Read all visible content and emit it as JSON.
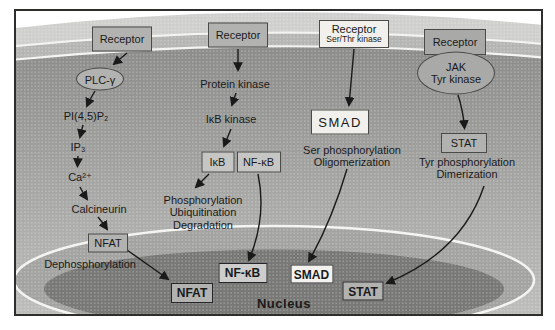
{
  "colors": {
    "ink": "#1a1a1a",
    "membrane_light": "#cfcfcd",
    "membrane_dark": "#b5b5b3",
    "cytoplasm_top": "#8c8c8a",
    "cytoplasm_bottom": "#bdbdbb",
    "nucleus_rim": "#a3a3a1",
    "nucleus_interior": "#787876",
    "highlight": "#f4f4f2",
    "box_gray": "#b2b2b0",
    "box_light_gray": "#c6c6c4",
    "box_white": "#f1f0ec",
    "border_dark": "#4a4a48"
  },
  "pathways": {
    "calcium_nfat": {
      "receptor": "Receptor",
      "plc": "PLC-γ",
      "pip2": "PI(4,5)P₂",
      "ip3": "IP₃",
      "calcium": "Ca²⁺",
      "calcineurin": "Calcineurin",
      "factor": "NFAT",
      "process": "Dephosphorylation"
    },
    "nfkb": {
      "receptor": "Receptor",
      "kinase1": "Protein kinase",
      "kinase2": "IκB kinase",
      "inhibitor": "IκB",
      "factor": "NF-κB",
      "process_lines": [
        "Phosphorylation",
        "Ubiquitination",
        "Degradation"
      ]
    },
    "smad": {
      "receptor": "Receptor",
      "receptor_sub": "Ser/Thr kinase",
      "factor": "SMAD",
      "process_lines": [
        "Ser phosphorylation",
        "Oligomerization"
      ]
    },
    "jak_stat": {
      "receptor": "Receptor",
      "jak_line1": "JAK",
      "jak_line2": "Tyr kinase",
      "factor": "STAT",
      "process_lines": [
        "Tyr phosphorylation",
        "Dimerization"
      ]
    }
  },
  "nucleus": {
    "label": "Nucleus",
    "factors": {
      "nfat": "NFAT",
      "nfkb": "NF-κB",
      "smad": "SMAD",
      "stat": "STAT"
    }
  }
}
